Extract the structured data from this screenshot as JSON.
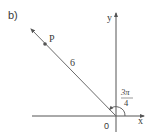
{
  "figure": {
    "part_label": "b)",
    "axes": {
      "x_label": "x",
      "y_label": "y",
      "origin_label": "0"
    },
    "ray": {
      "length_label": "6",
      "point_label": "P"
    },
    "angle": {
      "numerator": "3π",
      "denominator": "4",
      "value_text": "3π/4"
    },
    "colors": {
      "axis": "#555555",
      "ray": "#6a6a6a",
      "text": "#3a3a3a"
    }
  }
}
